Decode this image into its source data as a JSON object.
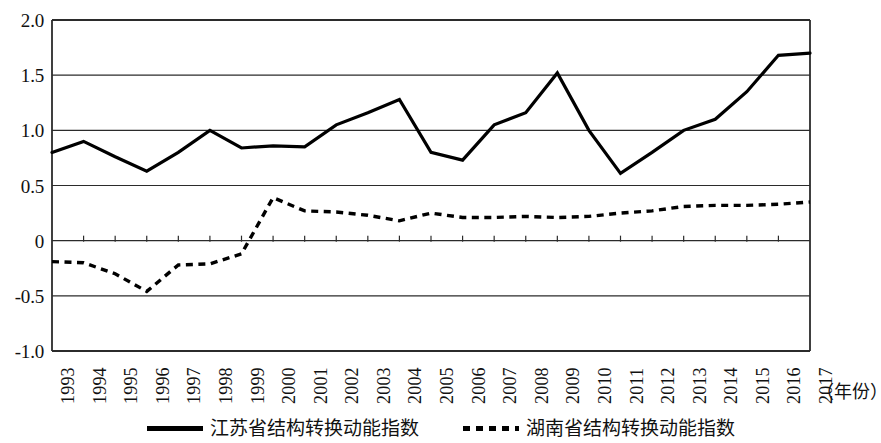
{
  "chart_data": {
    "type": "line",
    "title": "",
    "subtitle": "",
    "xlabel": "（年份）",
    "ylabel": "",
    "grid": true,
    "legend_position": "bottom",
    "ylim": [
      -1.0,
      2.0
    ],
    "ytick_labels": [
      "2.0",
      "1.5",
      "1.0",
      "0.5",
      "0",
      "-0.5",
      "-1.0"
    ],
    "ytick_values": [
      2.0,
      1.5,
      1.0,
      0.5,
      0,
      -0.5,
      -1.0
    ],
    "categories": [
      "1993",
      "1994",
      "1995",
      "1996",
      "1997",
      "1998",
      "1999",
      "2000",
      "2001",
      "2002",
      "2003",
      "2004",
      "2005",
      "2006",
      "2007",
      "2008",
      "2009",
      "2010",
      "2011",
      "2012",
      "2013",
      "2014",
      "2015",
      "2016",
      "2017"
    ],
    "series": [
      {
        "name": "江苏省结构转换动能指数",
        "style": "solid",
        "color": "#000000",
        "values": [
          0.8,
          0.9,
          0.76,
          0.63,
          0.8,
          1.0,
          0.84,
          0.86,
          0.85,
          1.05,
          1.16,
          1.28,
          0.8,
          0.73,
          1.05,
          1.16,
          1.52,
          1.0,
          0.61,
          0.8,
          1.0,
          1.1,
          1.35,
          1.68,
          1.7
        ]
      },
      {
        "name": "湖南省结构转换动能指数",
        "style": "dotted",
        "color": "#000000",
        "values": [
          -0.19,
          -0.2,
          -0.3,
          -0.46,
          -0.22,
          -0.21,
          -0.12,
          0.39,
          0.27,
          0.26,
          0.23,
          0.18,
          0.25,
          0.21,
          0.21,
          0.22,
          0.21,
          0.22,
          0.25,
          0.27,
          0.31,
          0.32,
          0.32,
          0.33,
          0.35
        ]
      }
    ]
  },
  "legend": {
    "items": [
      {
        "label": "江苏省结构转换动能指数",
        "style": "solid"
      },
      {
        "label": "湖南省结构转换动能指数",
        "style": "dotted"
      }
    ]
  }
}
